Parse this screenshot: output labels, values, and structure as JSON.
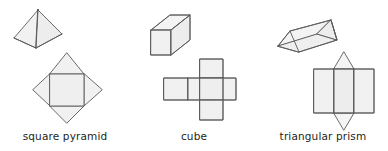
{
  "figure": {
    "background_color": "#ffffff",
    "stroke_color": "#58595b",
    "fill_color": "#f1f1f1",
    "label_color": "#231f20",
    "shapes": [
      {
        "id": "square-pyramid",
        "label": "square pyramid",
        "solid_view": "3d square pyramid with hidden base edges dashed",
        "net_view": "square with four triangular flaps forming a star"
      },
      {
        "id": "cube",
        "label": "cube",
        "solid_view": "3d cube in oblique projection with hidden edges dashed",
        "net_view": "cross of six squares"
      },
      {
        "id": "triangular-prism",
        "label": "triangular prism",
        "solid_view": "3d tilted triangular prism with hidden edges dashed",
        "net_view": "three rectangles with two triangles above and below the middle rectangle"
      }
    ]
  }
}
